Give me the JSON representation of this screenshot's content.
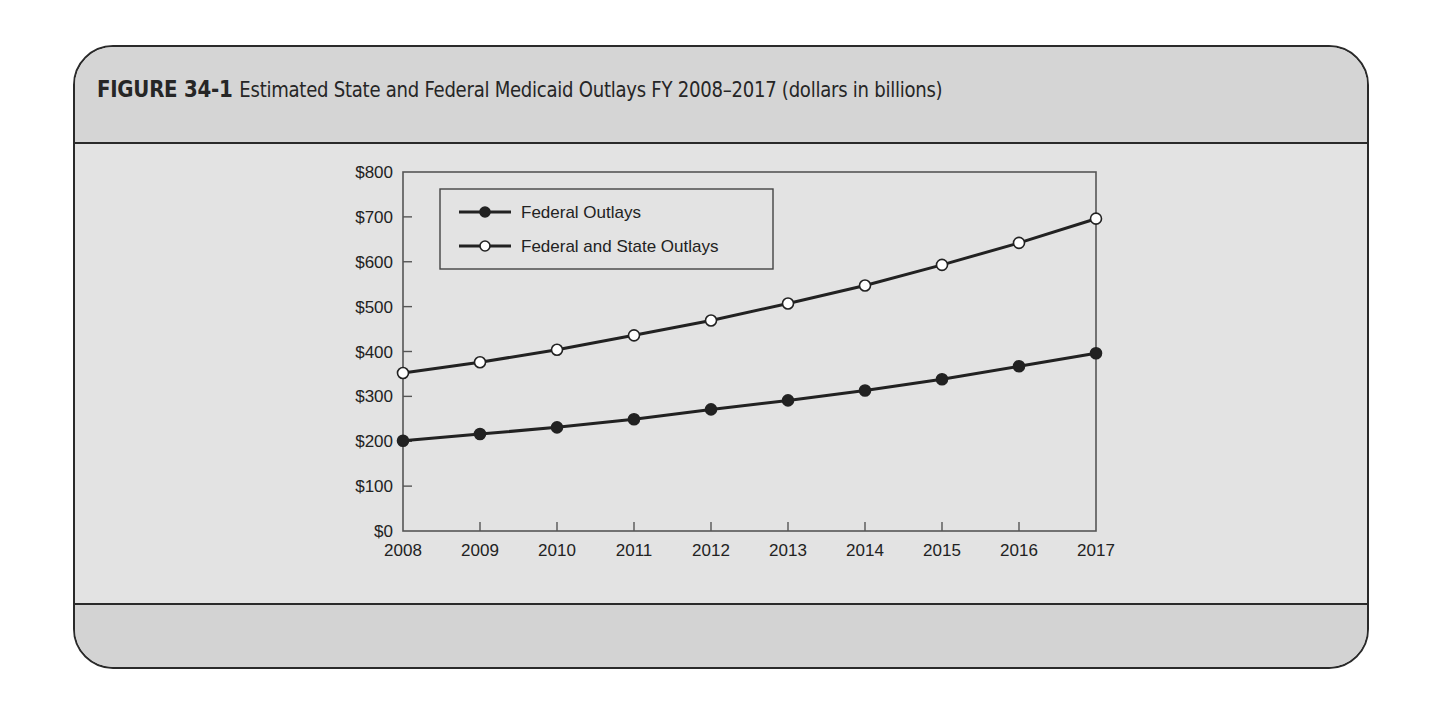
{
  "figure": {
    "label": "FIGURE 34-1",
    "caption": "Estimated State and Federal Medicaid Outlays FY 2008–2017 (dollars in billions)"
  },
  "colors": {
    "header_band": "#d5d5d5",
    "body": "#e3e3e3",
    "footer_band": "#d3d3d3",
    "line": "#222222",
    "frame": "#2a2a2a"
  },
  "chart_data": {
    "type": "line",
    "title": "Estimated State and Federal Medicaid Outlays FY 2008–2017 (dollars in billions)",
    "xlabel": "",
    "ylabel": "",
    "x": [
      2008,
      2009,
      2010,
      2011,
      2012,
      2013,
      2014,
      2015,
      2016,
      2017
    ],
    "x_tick_labels": [
      "2008",
      "2009",
      "2010",
      "2011",
      "2012",
      "2013",
      "2014",
      "2015",
      "2016",
      "2017"
    ],
    "y_tick_labels": [
      "$0",
      "$100",
      "$200",
      "$300",
      "$400",
      "$500",
      "$600",
      "$700",
      "$800"
    ],
    "ylim": [
      0,
      800
    ],
    "grid": false,
    "legend_position": "upper left (inside plot)",
    "series": [
      {
        "name": "Federal Outlays",
        "marker": "filled-circle",
        "values": [
          201,
          216,
          231,
          249,
          271,
          291,
          313,
          338,
          367,
          396
        ]
      },
      {
        "name": "Federal and State Outlays",
        "marker": "open-circle",
        "values": [
          352,
          376,
          404,
          436,
          469,
          507,
          547,
          593,
          642,
          696
        ]
      }
    ]
  }
}
